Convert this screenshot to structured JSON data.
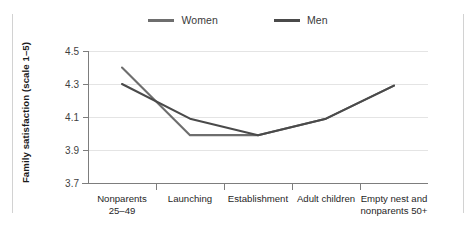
{
  "chart_data": {
    "type": "line",
    "title": "",
    "subtitle": "",
    "xlabel": "",
    "ylabel": "Family satisfaction (scale 1–5)",
    "categories": [
      "Nonparents 25–49",
      "Launching",
      "Establishment",
      "Adult children",
      "Empty nest and nonparents 50+"
    ],
    "category_lines": [
      [
        "Nonparents",
        "25–49"
      ],
      [
        "Launching"
      ],
      [
        "Establishment"
      ],
      [
        "Adult children"
      ],
      [
        "Empty nest and",
        "nonparents 50+"
      ]
    ],
    "series": [
      {
        "name": "Women",
        "color": "#6e6e6e",
        "values": [
          4.4,
          3.99,
          3.99,
          4.09,
          4.29
        ]
      },
      {
        "name": "Men",
        "color": "#4a4a4a",
        "values": [
          4.3,
          4.09,
          3.99,
          4.09,
          4.29
        ]
      }
    ],
    "ylim": [
      3.7,
      4.5
    ],
    "yticks": [
      3.7,
      3.9,
      4.1,
      4.3,
      4.5
    ],
    "ytick_labels": [
      "3.7",
      "3.9",
      "4.1",
      "4.3",
      "4.5"
    ],
    "grid": true,
    "grid_axis": "y",
    "legend_position": "top-center",
    "legend_entries": [
      "Women",
      "Men"
    ]
  },
  "legend": {
    "items": [
      {
        "label": "Women",
        "color": "#6e6e6e"
      },
      {
        "label": "Men",
        "color": "#4a4a4a"
      }
    ]
  },
  "axes": {
    "y_title": "Family satisfaction (scale 1–5)",
    "y_tick_labels": [
      "4.5",
      "4.3",
      "4.1",
      "3.9",
      "3.7"
    ],
    "x_tick_labels": [
      "Nonparents 25–49",
      "Launching",
      "Establishment",
      "Adult children",
      "Empty nest and nonparents 50+"
    ]
  },
  "colors": {
    "women": "#6e6e6e",
    "men": "#4a4a4a",
    "grid": "#e4e4e4",
    "axis": "#7d7d7d",
    "edge_rule": "#d2d2d2",
    "background": "#ffffff"
  }
}
